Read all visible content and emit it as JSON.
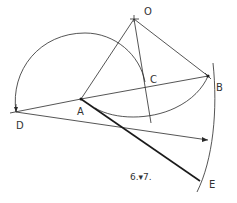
{
  "figure": {
    "caption": "6.▾7.",
    "points": {
      "O": "O",
      "A": "A",
      "B": "B",
      "C": "C",
      "D": "D",
      "E": "E"
    },
    "stroke_color": "#2a2a2a",
    "background": "#ffffff"
  }
}
